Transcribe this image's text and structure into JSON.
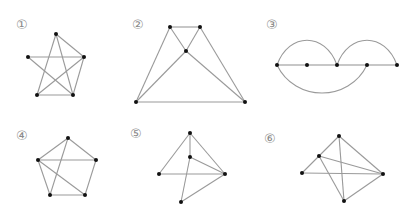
{
  "figures": [
    {
      "label": "①",
      "label_pos": [
        16,
        18
      ],
      "vertices": [
        [
          56,
          34
        ],
        [
          28,
          57
        ],
        [
          84,
          57
        ],
        [
          37,
          95
        ],
        [
          73,
          95
        ]
      ],
      "edges": [
        [
          0,
          3
        ],
        [
          0,
          4
        ],
        [
          0,
          2
        ],
        [
          1,
          2
        ],
        [
          1,
          4
        ],
        [
          3,
          2
        ],
        [
          3,
          4
        ],
        [
          2,
          4
        ]
      ],
      "arcs": []
    },
    {
      "label": "②",
      "label_pos": [
        132,
        18
      ],
      "vertices": [
        [
          170,
          27
        ],
        [
          200,
          27
        ],
        [
          186,
          51
        ],
        [
          136,
          102
        ],
        [
          245,
          102
        ]
      ],
      "edges": [
        [
          0,
          1
        ],
        [
          0,
          3
        ],
        [
          0,
          2
        ],
        [
          2,
          4
        ],
        [
          1,
          2
        ],
        [
          2,
          3
        ],
        [
          1,
          4
        ],
        [
          3,
          4
        ]
      ],
      "arcs": []
    },
    {
      "label": "③",
      "label_pos": [
        266,
        18
      ],
      "vertices": [
        [
          277,
          65
        ],
        [
          307,
          65
        ],
        [
          337,
          65
        ],
        [
          367,
          65
        ],
        [
          397,
          65
        ]
      ],
      "edges": [
        [
          0,
          1
        ],
        [
          1,
          2
        ],
        [
          2,
          3
        ],
        [
          3,
          4
        ]
      ],
      "arcs": [
        {
          "from": 0,
          "to": 2,
          "side": "top",
          "height": 30
        },
        {
          "from": 2,
          "to": 4,
          "side": "top",
          "height": 30
        },
        {
          "from": 0,
          "to": 3,
          "side": "bottom",
          "height": 34
        }
      ]
    },
    {
      "label": "④",
      "label_pos": [
        16,
        129
      ],
      "vertices": [
        [
          68,
          138
        ],
        [
          38,
          160
        ],
        [
          96,
          160
        ],
        [
          50,
          195
        ],
        [
          85,
          195
        ]
      ],
      "edges": [
        [
          0,
          1
        ],
        [
          0,
          2
        ],
        [
          1,
          2
        ],
        [
          0,
          3
        ],
        [
          1,
          3
        ],
        [
          1,
          4
        ],
        [
          2,
          4
        ],
        [
          3,
          4
        ]
      ],
      "arcs": []
    },
    {
      "label": "⑤",
      "label_pos": [
        130,
        127
      ],
      "vertices": [
        [
          190,
          133
        ],
        [
          190,
          157
        ],
        [
          159,
          174
        ],
        [
          225,
          174
        ],
        [
          181,
          202
        ]
      ],
      "edges": [
        [
          0,
          2
        ],
        [
          0,
          3
        ],
        [
          0,
          1
        ],
        [
          1,
          3
        ],
        [
          2,
          3
        ],
        [
          1,
          4
        ],
        [
          4,
          3
        ]
      ],
      "arcs": []
    },
    {
      "label": "⑥",
      "label_pos": [
        264,
        132
      ],
      "vertices": [
        [
          339,
          136
        ],
        [
          319,
          156
        ],
        [
          302,
          173
        ],
        [
          383,
          174
        ],
        [
          344,
          201
        ]
      ],
      "edges": [
        [
          0,
          1
        ],
        [
          1,
          2
        ],
        [
          2,
          3
        ],
        [
          0,
          3
        ],
        [
          0,
          4
        ],
        [
          1,
          3
        ],
        [
          1,
          4
        ],
        [
          4,
          3
        ]
      ],
      "arcs": []
    }
  ],
  "style": {
    "edge_color": "#9a9a9a",
    "vertex_color": "#111111",
    "label_color": "#8a8a8a"
  }
}
